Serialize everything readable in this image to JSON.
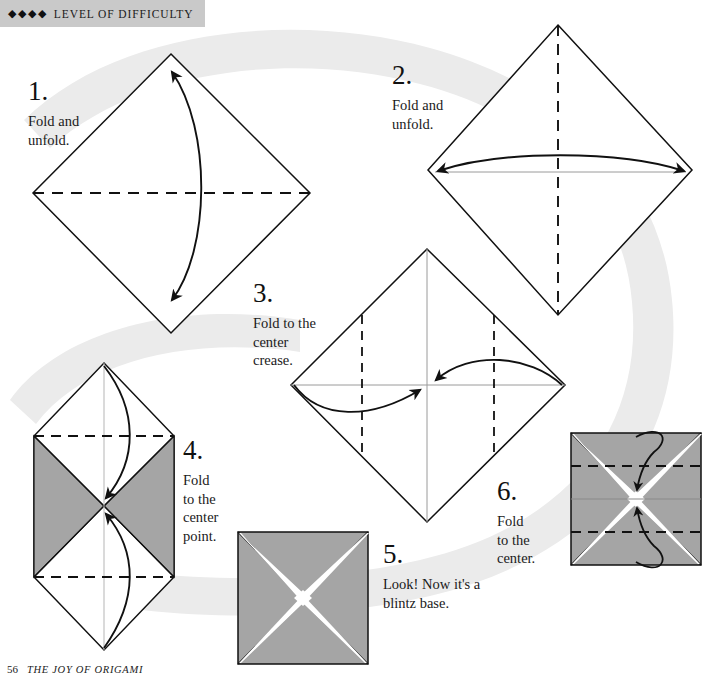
{
  "page": {
    "width": 711,
    "height": 681,
    "background_color": "#ffffff"
  },
  "header": {
    "diamonds": "◆◆◆◆",
    "difficulty_count": 4,
    "label": "LEVEL OF DIFFICULTY",
    "banner_color": "#c9c9c9"
  },
  "footer": {
    "page_number": "56",
    "book_title": "THE JOY OF ORIGAMI"
  },
  "colors": {
    "paper_gray": "#a5a5a5",
    "paper_white": "#ffffff",
    "line": "#111111",
    "crease_gray": "#9a9a9a",
    "swoosh": "#ebebeb",
    "banner": "#c9c9c9"
  },
  "steps": [
    {
      "number": "1.",
      "text": "Fold and\nunfold.",
      "caption_x": 28,
      "caption_y": 78,
      "figure": "diamond-horizontal-crease",
      "arrow": "double-headed vertical curve"
    },
    {
      "number": "2.",
      "text": "Fold and\nunfold.",
      "caption_x": 392,
      "caption_y": 62,
      "figure": "diamond-vertical-crease",
      "arrow": "double-headed horizontal curve"
    },
    {
      "number": "3.",
      "text": "Fold to the\ncenter\ncrease.",
      "caption_x": 253,
      "caption_y": 280,
      "figure": "diamond-two-vertical-creases",
      "arrow": "two curved arrows to center"
    },
    {
      "number": "4.",
      "text": "Fold\nto the\ncenter\npoint.",
      "caption_x": 183,
      "caption_y": 437,
      "figure": "hexagon-two-horizontal-creases",
      "arrow": "two curved arrows to center point"
    },
    {
      "number": "5.",
      "text": "Look! Now it's a\nblintz base.",
      "caption_x": 383,
      "caption_y": 541,
      "figure": "blintz-base-square",
      "arrow": "none"
    },
    {
      "number": "6.",
      "text": "Fold\nto the\ncenter.",
      "caption_x": 497,
      "caption_y": 478,
      "figure": "square-two-horizontal-creases",
      "arrow": "looping arrow to center"
    }
  ]
}
